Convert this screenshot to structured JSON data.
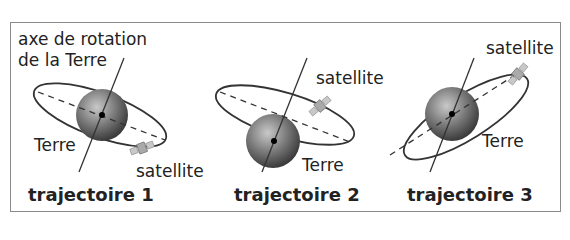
{
  "panels": [
    {
      "title": "trajectoire 1",
      "axis_label_line1": "axe de rotation",
      "axis_label_line2": "de la Terre",
      "earth_label": "Terre",
      "satellite_label": "satellite"
    },
    {
      "title": "trajectoire 2",
      "earth_label": "Terre",
      "satellite_label": "satellite"
    },
    {
      "title": "trajectoire 3",
      "earth_label": "Terre",
      "satellite_label": "satellite"
    }
  ],
  "colors": {
    "frame": "#8a8a8a",
    "orbit": "#333333",
    "earth": "#6f6f6f",
    "text": "#222222"
  }
}
